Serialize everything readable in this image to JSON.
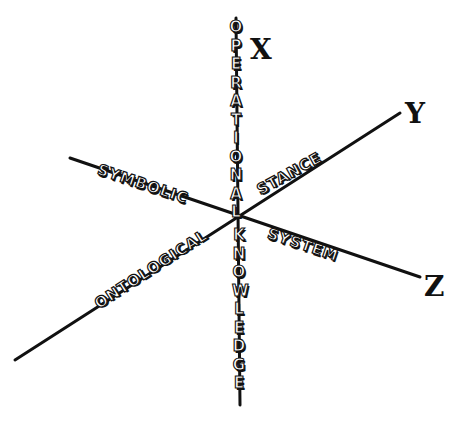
{
  "diagram": {
    "axes": [
      {
        "id": "x",
        "label": "X",
        "line": {
          "x1": 236,
          "y1": 18,
          "x2": 240,
          "y2": 405
        }
      },
      {
        "id": "y",
        "label": "Y",
        "line": {
          "x1": 15,
          "y1": 360,
          "x2": 400,
          "y2": 113
        }
      },
      {
        "id": "z",
        "label": "Z",
        "line": {
          "x1": 70,
          "y1": 158,
          "x2": 420,
          "y2": 277
        }
      }
    ],
    "axis_labels": {
      "x": "X",
      "y": "Y",
      "z": "Z"
    },
    "words": {
      "operational": "OPERATIONAL",
      "knowledge": "KNOWLEDGE",
      "symbolic": "SYMBOLIC",
      "system": "SYSTEM",
      "ontological": "ONTOLOGICAL",
      "stance": "STANCE"
    },
    "origin": {
      "x": 237,
      "y": 216
    },
    "colors": {
      "ink": "#111111",
      "background": "#ffffff"
    }
  }
}
